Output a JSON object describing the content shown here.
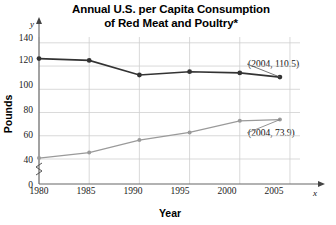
{
  "chart_data": {
    "type": "line",
    "title": "Annual U.S. per Capita Consumption of Red Meat and Poultry*",
    "title_line1": "Annual U.S. per Capita Consumption",
    "title_line2": "of Red Meat and Poultry*",
    "xlabel": "Year",
    "ylabel": "Pounds",
    "x_axis_symbol": "x",
    "y_axis_symbol": "y",
    "x": [
      1980,
      1985,
      1990,
      1995,
      2000,
      2004
    ],
    "xlim": [
      1980,
      2006
    ],
    "ylim": [
      40,
      145
    ],
    "y_axis_break": true,
    "yticks": [
      0,
      40,
      60,
      80,
      100,
      120,
      140
    ],
    "ytick_labels": [
      "0",
      "40",
      "60",
      "80",
      "100",
      "120",
      "140"
    ],
    "xticks": [
      1980,
      1985,
      1990,
      1995,
      2000,
      2005
    ],
    "xtick_labels": [
      "1980",
      "1985",
      "1990",
      "1995",
      "2000",
      "2005"
    ],
    "grid": true,
    "legend": "none",
    "series": [
      {
        "name": "Red Meat",
        "color": "#333333",
        "marker": "circle",
        "values": [
          126.4,
          124.9,
          112.3,
          115.1,
          114.1,
          110.5
        ]
      },
      {
        "name": "Poultry",
        "color": "#9a9a9a",
        "marker": "circle",
        "values": [
          40.8,
          45.5,
          56.3,
          62.9,
          72.9,
          73.9
        ]
      }
    ],
    "annotations": [
      {
        "id": "redmeat",
        "label": "(2004, 110.5)",
        "x": 2004,
        "y": 110.5
      },
      {
        "id": "poultry",
        "label": "(2004, 73.9)",
        "x": 2004,
        "y": 73.9
      }
    ]
  },
  "colors": {
    "red_meat_line": "#333333",
    "poultry_line": "#9a9a9a",
    "grid": "#cfcfcf",
    "axis": "#555555",
    "text": "#000000",
    "background": "#ffffff"
  }
}
